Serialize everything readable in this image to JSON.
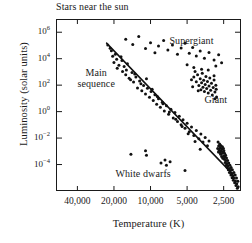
{
  "chart_data": {
    "type": "scatter",
    "title": "Stars near the sun",
    "xlabel": "Temperature (K)",
    "ylabel": "Luminosity (solar units)",
    "x_axis": {
      "scale": "log-reversed",
      "unit": "K",
      "tick_values": [
        40000,
        20000,
        10000,
        5000,
        2500
      ],
      "tick_labels": [
        "40,000",
        "20,000",
        "10,000",
        "5,000",
        "2,500"
      ],
      "xlim": [
        60000,
        1800
      ]
    },
    "y_axis": {
      "scale": "log",
      "unit": "solar units",
      "tick_values": [
        1000000,
        10000,
        100,
        1,
        0.01,
        0.0001
      ],
      "tick_labels": [
        "10^6",
        "10^4",
        "10^2",
        "10^0",
        "10^-2",
        "10^-4"
      ],
      "tick_mantissa": [
        "10",
        "10",
        "10",
        "10",
        "10",
        "10"
      ],
      "tick_exponents": [
        "6",
        "4",
        "2",
        "0",
        "-2",
        "-4"
      ],
      "ylim": [
        10000000.0,
        1e-06
      ]
    },
    "grid": false,
    "legend": "none",
    "annotations": [
      {
        "name": "main-sequence",
        "text": "Main\nsequence",
        "x_k": 28000,
        "y_lsun": 900
      },
      {
        "name": "supergiant",
        "text": "Supergiant",
        "x_k": 4600,
        "y_lsun": 200000
      },
      {
        "name": "giant",
        "text": "Giant",
        "x_k": 2900,
        "y_lsun": 7
      },
      {
        "name": "white-dwarfs",
        "text": "White dwarfs",
        "x_k": 11500,
        "y_lsun": 2e-05
      }
    ],
    "series": [
      {
        "name": "main-sequence-line",
        "type": "line",
        "points": [
          [
            23000,
            150000
          ],
          [
            2100,
            1.8e-05
          ]
        ]
      },
      {
        "name": "main-sequence-stars",
        "type": "scatter",
        "points": [
          [
            22500,
            110000
          ],
          [
            21000,
            40000
          ],
          [
            20500,
            15000
          ],
          [
            19500,
            22000
          ],
          [
            19000,
            9000
          ],
          [
            18200,
            3200
          ],
          [
            17500,
            14000
          ],
          [
            17000,
            1100
          ],
          [
            16500,
            2600
          ],
          [
            16000,
            600
          ],
          [
            15500,
            4200
          ],
          [
            15000,
            330
          ],
          [
            14200,
            900
          ],
          [
            13800,
            170
          ],
          [
            13200,
            420
          ],
          [
            12800,
            62
          ],
          [
            12300,
            210
          ],
          [
            11800,
            38
          ],
          [
            11400,
            95
          ],
          [
            11000,
            21
          ],
          [
            10600,
            58
          ],
          [
            10200,
            12
          ],
          [
            9900,
            33
          ],
          [
            9500,
            7
          ],
          [
            9200,
            19
          ],
          [
            8900,
            3.6
          ],
          [
            8600,
            9.5
          ],
          [
            8300,
            2.1
          ],
          [
            8000,
            5.2
          ],
          [
            7700,
            1.1
          ],
          [
            7400,
            2.8
          ],
          [
            7100,
            0.62
          ],
          [
            6800,
            1.5
          ],
          [
            6500,
            0.33
          ],
          [
            6300,
            0.85
          ],
          [
            6000,
            0.18
          ],
          [
            5800,
            0.45
          ],
          [
            5600,
            0.1
          ],
          [
            5400,
            0.24
          ],
          [
            5200,
            0.055
          ],
          [
            5000,
            0.13
          ],
          [
            4800,
            0.03
          ],
          [
            4600,
            0.07
          ],
          [
            4400,
            0.016
          ],
          [
            4200,
            0.038
          ],
          [
            4000,
            0.009
          ],
          [
            3850,
            0.02
          ],
          [
            3700,
            0.005
          ],
          [
            3550,
            0.011
          ],
          [
            3400,
            0.0026
          ],
          [
            3300,
            0.006
          ],
          [
            21500,
            62000
          ],
          [
            20000,
            5200
          ],
          [
            18800,
            1900
          ],
          [
            17200,
            7200
          ],
          [
            15800,
            1400
          ],
          [
            14600,
            260
          ],
          [
            13500,
            700
          ],
          [
            12000,
            130
          ],
          [
            10800,
            300
          ],
          [
            9700,
            48
          ],
          [
            8800,
            14
          ],
          [
            7900,
            3.9
          ],
          [
            7000,
            0.95
          ],
          [
            6200,
            0.27
          ],
          [
            5500,
            0.075
          ],
          [
            4900,
            0.021
          ],
          [
            4300,
            0.0055
          ],
          [
            3900,
            0.0014
          ]
        ]
      },
      {
        "name": "cool-dwarf-cluster",
        "type": "scatter",
        "points": [
          [
            2750,
            0.0025
          ],
          [
            2720,
            0.0012
          ],
          [
            2700,
            0.0035
          ],
          [
            2690,
            0.0008
          ],
          [
            2670,
            0.0018
          ],
          [
            2650,
            0.0006
          ],
          [
            2640,
            0.0028
          ],
          [
            2620,
            0.0011
          ],
          [
            2600,
            0.0004
          ],
          [
            2590,
            0.0015
          ],
          [
            2570,
            0.0007
          ],
          [
            2560,
            0.0022
          ],
          [
            2540,
            0.0003
          ],
          [
            2530,
            0.0009
          ],
          [
            2510,
            0.0016
          ],
          [
            2500,
            0.00045
          ],
          [
            2490,
            0.0011
          ],
          [
            2470,
            0.00025
          ],
          [
            2460,
            0.0007
          ],
          [
            2440,
            0.00038
          ],
          [
            2430,
            0.00014
          ],
          [
            2410,
            0.0005
          ],
          [
            2400,
            0.0002
          ],
          [
            2380,
            9e-05
          ],
          [
            2370,
            0.00031
          ],
          [
            2350,
            0.00012
          ],
          [
            2340,
            6e-05
          ],
          [
            2320,
            0.0002
          ],
          [
            2300,
            8e-05
          ],
          [
            2290,
            4e-05
          ],
          [
            2270,
            0.00013
          ],
          [
            2250,
            5e-05
          ],
          [
            2240,
            2.5e-05
          ],
          [
            2220,
            9e-05
          ],
          [
            2200,
            3.5e-05
          ],
          [
            2180,
            1.6e-05
          ],
          [
            2170,
            6e-05
          ],
          [
            2150,
            2.2e-05
          ],
          [
            2130,
            1e-05
          ],
          [
            2120,
            4e-05
          ],
          [
            2100,
            1.4e-05
          ],
          [
            2080,
            6.5e-06
          ],
          [
            2060,
            2.5e-05
          ],
          [
            2050,
            9.5e-06
          ],
          [
            2030,
            4.2e-06
          ],
          [
            2010,
            1.6e-05
          ],
          [
            2000,
            5.8e-06
          ],
          [
            1980,
            2.6e-06
          ],
          [
            1960,
            9.5e-06
          ],
          [
            1950,
            3.6e-06
          ],
          [
            1930,
            1.6e-06
          ],
          [
            1910,
            5.5e-06
          ],
          [
            1900,
            2.1e-06
          ],
          [
            2800,
            0.0016
          ],
          [
            2780,
            0.005
          ],
          [
            2760,
            0.0009
          ]
        ]
      },
      {
        "name": "giant-branch",
        "type": "scatter",
        "points": [
          [
            4400,
            420
          ],
          [
            4200,
            180
          ],
          [
            4100,
            620
          ],
          [
            4000,
            95
          ],
          [
            3900,
            300
          ],
          [
            3850,
            45
          ],
          [
            3800,
            150
          ],
          [
            3750,
            800
          ],
          [
            3700,
            70
          ],
          [
            3650,
            230
          ],
          [
            3600,
            33
          ],
          [
            3550,
            110
          ],
          [
            3500,
            460
          ],
          [
            3450,
            55
          ],
          [
            3400,
            190
          ],
          [
            3350,
            26
          ],
          [
            3300,
            85
          ],
          [
            3250,
            350
          ],
          [
            3200,
            42
          ],
          [
            3150,
            140
          ],
          [
            3100,
            18
          ],
          [
            3050,
            66
          ],
          [
            3000,
            250
          ],
          [
            2950,
            30
          ],
          [
            2900,
            100
          ],
          [
            2860,
            13
          ],
          [
            4600,
            260
          ],
          [
            4500,
            75
          ],
          [
            4300,
            1100
          ],
          [
            4050,
            38
          ],
          [
            3000,
            520
          ],
          [
            2950,
            9.5
          ],
          [
            3350,
            1400
          ],
          [
            2880,
            48
          ]
        ]
      },
      {
        "name": "supergiants",
        "type": "scatter",
        "points": [
          [
            16000,
            300000
          ],
          [
            14000,
            120000
          ],
          [
            12500,
            480000
          ],
          [
            11000,
            60000
          ],
          [
            10000,
            160000
          ],
          [
            9200,
            28000
          ],
          [
            8600,
            90000
          ],
          [
            7800,
            240000
          ],
          [
            7200,
            45000
          ],
          [
            6600,
            110000
          ],
          [
            6000,
            22000
          ],
          [
            5600,
            65000
          ],
          [
            5200,
            150000
          ],
          [
            4800,
            26000
          ],
          [
            4500,
            70000
          ],
          [
            4200,
            16000
          ],
          [
            3900,
            38000
          ],
          [
            3600,
            11000
          ],
          [
            3300,
            30000
          ],
          [
            3000,
            8000
          ],
          [
            2750,
            20000
          ],
          [
            2600,
            5000
          ],
          [
            5000,
            3500
          ],
          [
            4400,
            2200
          ],
          [
            3800,
            1600
          ],
          [
            2900,
            2800
          ]
        ]
      },
      {
        "name": "white-dwarfs",
        "type": "scatter",
        "points": [
          [
            14500,
            0.0006
          ],
          [
            11000,
            0.0011
          ],
          [
            10800,
            0.0005
          ],
          [
            8200,
            0.00013
          ],
          [
            7600,
            0.00022
          ],
          [
            7400,
            9e-05
          ],
          [
            6900,
            0.00016
          ],
          [
            5200,
            3.5e-05
          ]
        ]
      }
    ]
  }
}
